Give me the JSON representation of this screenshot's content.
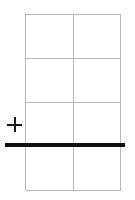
{
  "canvas": {
    "width": 135,
    "height": 200,
    "background": "#ffffff"
  },
  "grid": {
    "name": "grid-table",
    "x": 25,
    "y": 14,
    "width": 96,
    "height": 176,
    "columns": 2,
    "rows": 4,
    "line_color": "#b9b9b9",
    "line_width": 1,
    "cell_width": 48,
    "cell_height": 44,
    "cells": [
      [
        {
          "label": ""
        },
        {
          "label": ""
        }
      ],
      [
        {
          "label": ""
        },
        {
          "label": ""
        }
      ],
      [
        {
          "label": ""
        },
        {
          "label": ""
        }
      ],
      [
        {
          "label": ""
        },
        {
          "label": ""
        }
      ]
    ]
  },
  "rule": {
    "name": "horizontal-rule",
    "x": 5,
    "y": 143,
    "width": 120,
    "height": 4,
    "color": "#111111",
    "label": ""
  },
  "plus_marker": {
    "name": "plus-icon",
    "x": 7,
    "y": 117,
    "size": 15,
    "stroke": 2,
    "color": "#1a1a1a",
    "glyph": "+",
    "label": ""
  },
  "accessibility": {
    "description": "Blank two-column by four-row grid with a thick black horizontal line crossing it and a small plus marker at the left"
  }
}
